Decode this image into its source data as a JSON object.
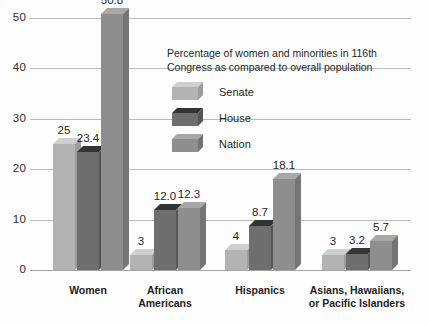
{
  "chart_data": {
    "type": "bar",
    "title": "",
    "xlabel": "",
    "ylabel": "",
    "ylim": [
      0,
      50
    ],
    "yticks": [
      "0",
      "10",
      "20",
      "30",
      "40",
      "50"
    ],
    "grid": true,
    "legend_position": "inside-upper-right",
    "legend_title": {
      "line1": "Percentage of women and minorities in 116th",
      "line2": "Congress as compared to overall population"
    },
    "categories": [
      "Women",
      "African Americans",
      "Hispanics",
      "Asians, Hawaiians, or Pacific Islanders"
    ],
    "category_label_lines": [
      [
        "Women"
      ],
      [
        "African",
        "Americans"
      ],
      [
        "Hispanics"
      ],
      [
        "Asians, Hawaiians,",
        "or Pacific Islanders"
      ]
    ],
    "series": [
      {
        "name": "Senate",
        "color": "#b3b3b3",
        "values": [
          25,
          3,
          4,
          3
        ],
        "labels": [
          "25",
          "3",
          "4",
          "3"
        ]
      },
      {
        "name": "House",
        "color": "#6e6e6e",
        "values": [
          23.4,
          12.0,
          8.7,
          3.2
        ],
        "labels": [
          "23.4",
          "12.0",
          "8.7",
          "3.2"
        ]
      },
      {
        "name": "Nation",
        "color": "#8e8e8e",
        "values": [
          50.8,
          12.3,
          18.1,
          5.7
        ],
        "labels": [
          "50.8",
          "12.3",
          "18.1",
          "5.7"
        ]
      }
    ]
  },
  "colors": {
    "gridline": "#b9bcbe",
    "text": "#1f1f1f",
    "background": "#fdfdfd"
  }
}
